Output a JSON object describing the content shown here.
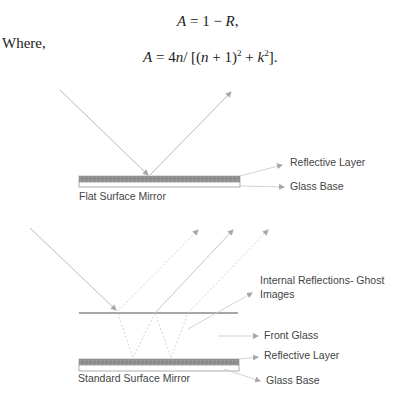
{
  "equations": {
    "eq1": {
      "lhs": "A",
      "op": " = 1 − ",
      "r": "R",
      "tail": ","
    },
    "where_label": "Where,",
    "eq2": {
      "lhs": "A",
      "text1": " = 4",
      "n1": "n",
      "text2": "/ [(",
      "n2": "n",
      "text3": " + 1)",
      "sup1": "2",
      "text4": " + ",
      "k": "k",
      "sup2": "2",
      "text5": "]."
    }
  },
  "diagram_top": {
    "caption": "Flat Surface Mirror",
    "labels": {
      "reflective_layer": "Reflective Layer",
      "glass_base": "Glass Base"
    }
  },
  "diagram_bottom": {
    "caption": "Standard Surface Mirror",
    "labels": {
      "internal_reflections_line1": "Internal Reflections- Ghost",
      "internal_reflections_line2": "Images",
      "front_glass": "Front Glass",
      "reflective_layer": "Reflective Layer",
      "glass_base": "Glass Base"
    }
  },
  "colors": {
    "ray": "#b5b5b5",
    "reflective_layer": "#8c8c8c",
    "glass_outline": "#9a9a9a",
    "text": "#333333"
  }
}
